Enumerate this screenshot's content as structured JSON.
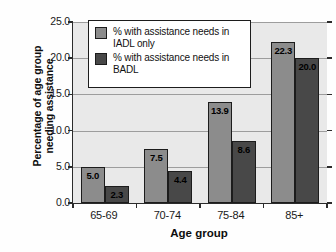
{
  "chart_data": {
    "type": "bar",
    "title": "",
    "xlabel": "Age group",
    "ylabel_line1": "Percentage of age group",
    "ylabel_line2": "needing assistance",
    "categories": [
      "65-69",
      "70-74",
      "75-84",
      "85+"
    ],
    "series": [
      {
        "name": "% with assistance needs in IADL only",
        "legend_line1": "% with assistance needs in",
        "legend_line2": "IADL only",
        "color": "#8c8c8c",
        "values": [
          5.0,
          7.5,
          13.9,
          22.3
        ],
        "labels": [
          "5.0",
          "7.5",
          "13.9",
          "22.3"
        ]
      },
      {
        "name": "% with assistance needs in BADL",
        "legend_line1": "% with assistance needs in",
        "legend_line2": "BADL",
        "color": "#484848",
        "values": [
          2.3,
          4.4,
          8.6,
          20.0
        ],
        "labels": [
          "2.3",
          "4.4",
          "8.6",
          "20.0"
        ]
      }
    ],
    "ylim": [
      0.0,
      25.0
    ],
    "ytick_values": [
      0.0,
      5.0,
      10.0,
      15.0,
      20.0,
      25.0
    ],
    "ytick_labels": [
      "0.0",
      "5.0",
      "10.0",
      "15.0",
      "20.0",
      "25.0"
    ],
    "grid": true,
    "legend_position": "top-left-inside",
    "plot_background": "#e9e9e9",
    "figure_background": "#fefefe",
    "axis_color": "#2b2b2b"
  }
}
